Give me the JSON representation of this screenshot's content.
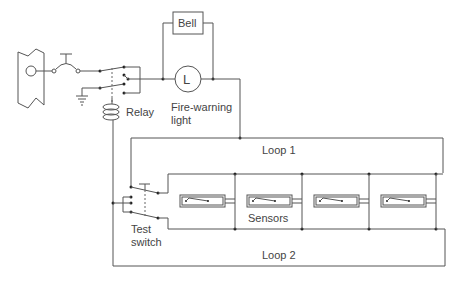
{
  "diagram": {
    "labels": {
      "bell": "Bell",
      "lamp_letter": "L",
      "light_line1": "Fire-warning",
      "light_line2": "light",
      "relay": "Relay",
      "loop1": "Loop 1",
      "loop2": "Loop 2",
      "sensors": "Sensors",
      "test_line1": "Test",
      "test_line2": "switch"
    },
    "components": [
      {
        "id": "power-source",
        "type": "battery/bus"
      },
      {
        "id": "master-switch",
        "type": "switch"
      },
      {
        "id": "relay",
        "type": "relay"
      },
      {
        "id": "bell",
        "type": "bell"
      },
      {
        "id": "fire-warning-light",
        "type": "lamp"
      },
      {
        "id": "test-switch",
        "type": "switch"
      },
      {
        "id": "sensor-1",
        "type": "sensor"
      },
      {
        "id": "sensor-2",
        "type": "sensor"
      },
      {
        "id": "sensor-3",
        "type": "sensor"
      },
      {
        "id": "sensor-4",
        "type": "sensor"
      }
    ],
    "colors": {
      "line": "#555555",
      "text": "#444444",
      "background": "#ffffff"
    }
  }
}
